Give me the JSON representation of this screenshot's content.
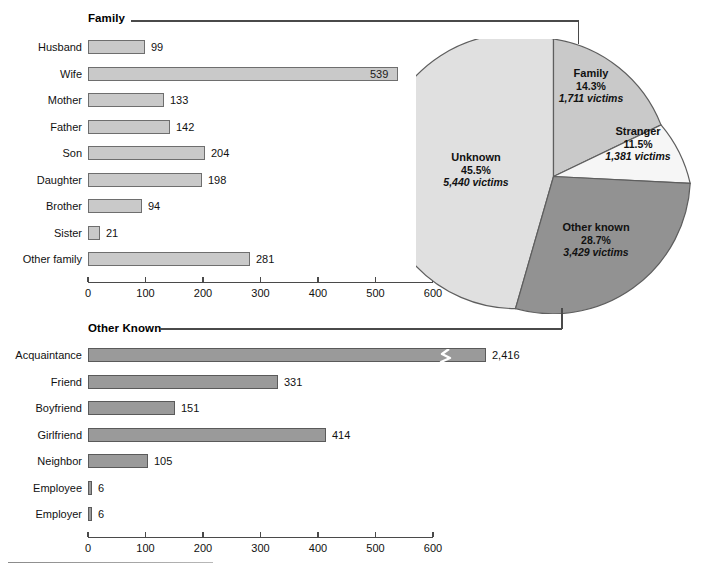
{
  "figure": {
    "sections": {
      "family_title": "Family",
      "other_known_title": "Other Known"
    }
  },
  "chart_data": [
    {
      "type": "bar",
      "orientation": "horizontal",
      "title": "Family",
      "xlabel": "",
      "ylabel": "",
      "xlim": [
        0,
        600
      ],
      "grid": false,
      "ticks": [
        "0",
        "100",
        "200",
        "300",
        "400",
        "500",
        "600"
      ],
      "tick_values": [
        0,
        100,
        200,
        300,
        400,
        500,
        600
      ],
      "categories": [
        "Husband",
        "Wife",
        "Mother",
        "Father",
        "Son",
        "Daughter",
        "Brother",
        "Sister",
        "Other family"
      ],
      "values": [
        99,
        539,
        133,
        142,
        204,
        198,
        94,
        21,
        281
      ],
      "value_labels": [
        "99",
        "539",
        "133",
        "142",
        "204",
        "198",
        "94",
        "21",
        "281"
      ],
      "label_inside": [
        false,
        true,
        false,
        false,
        false,
        false,
        false,
        false,
        false
      ],
      "bar_color": "#c9c9c9",
      "bar_border": "#6e6e6e"
    },
    {
      "type": "pie",
      "title": "",
      "legend": "in-slice labels",
      "total_victims": 11961,
      "slices": [
        {
          "name": "Family",
          "percent": 14.3,
          "percent_label": "14.3%",
          "victims": 1711,
          "victims_label": "1,711 victims",
          "color": "#c9c9c9"
        },
        {
          "name": "Stranger",
          "percent": 11.5,
          "percent_label": "11.5%",
          "victims": 1381,
          "victims_label": "1,381 victims",
          "color": "#f2f2f2"
        },
        {
          "name": "Other known",
          "percent": 28.7,
          "percent_label": "28.7%",
          "victims": 3429,
          "victims_label": "3,429 victims",
          "color": "#929292"
        },
        {
          "name": "Unknown",
          "percent": 45.5,
          "percent_label": "45.5%",
          "victims": 5440,
          "victims_label": "5,440 victims",
          "color": "#e0e0e0"
        }
      ]
    },
    {
      "type": "bar",
      "orientation": "horizontal",
      "title": "Other Known",
      "xlabel": "",
      "ylabel": "",
      "xlim": [
        0,
        600
      ],
      "grid": false,
      "ticks": [
        "0",
        "100",
        "200",
        "300",
        "400",
        "500",
        "600"
      ],
      "tick_values": [
        0,
        100,
        200,
        300,
        400,
        500,
        600
      ],
      "categories": [
        "Acquaintance",
        "Friend",
        "Boyfriend",
        "Girlfriend",
        "Neighbor",
        "Employee",
        "Employer"
      ],
      "values": [
        2416,
        331,
        151,
        414,
        105,
        6,
        6
      ],
      "value_labels": [
        "2,416",
        "331",
        "151",
        "414",
        "105",
        "6",
        "6"
      ],
      "axis_break": {
        "category": "Acquaintance",
        "note": "bar truncated with zigzag break",
        "drawn_to": 693
      },
      "bar_color": "#929292",
      "bar_border": "#5a5a5a"
    }
  ],
  "top_chart": {
    "rows": [
      {
        "label": "Husband",
        "value": "99",
        "w": 57,
        "inside": false
      },
      {
        "label": "Wife",
        "value": "539",
        "w": 310,
        "inside": true
      },
      {
        "label": "Mother",
        "value": "133",
        "w": 76,
        "inside": false
      },
      {
        "label": "Father",
        "value": "142",
        "w": 82,
        "inside": false
      },
      {
        "label": "Son",
        "value": "204",
        "w": 117,
        "inside": false
      },
      {
        "label": "Daughter",
        "value": "198",
        "w": 114,
        "inside": false
      },
      {
        "label": "Brother",
        "value": "94",
        "w": 54,
        "inside": false
      },
      {
        "label": "Sister",
        "value": "21",
        "w": 12,
        "inside": false
      },
      {
        "label": "Other family",
        "value": "281",
        "w": 162,
        "inside": false
      }
    ],
    "ticks": [
      "0",
      "100",
      "200",
      "300",
      "400",
      "500",
      "600"
    ]
  },
  "bottom_chart": {
    "rows": [
      {
        "label": "Acquaintance",
        "value": "2,416",
        "w": 398,
        "broken": true
      },
      {
        "label": "Friend",
        "value": "331",
        "w": 190,
        "broken": false
      },
      {
        "label": "Boyfriend",
        "value": "151",
        "w": 87,
        "broken": false
      },
      {
        "label": "Girlfriend",
        "value": "414",
        "w": 238,
        "broken": false
      },
      {
        "label": "Neighbor",
        "value": "105",
        "w": 60,
        "broken": false
      },
      {
        "label": "Employee",
        "value": "6",
        "w": 4,
        "broken": false
      },
      {
        "label": "Employer",
        "value": "6",
        "w": 4,
        "broken": false
      }
    ],
    "ticks": [
      "0",
      "100",
      "200",
      "300",
      "400",
      "500",
      "600"
    ]
  },
  "pie": {
    "slices": [
      {
        "name": "Family",
        "percent": "14.3%",
        "victims": "1,711 victims"
      },
      {
        "name": "Stranger",
        "percent": "11.5%",
        "victims": "1,381 victims"
      },
      {
        "name": "Other known",
        "percent": "28.7%",
        "victims": "3,429 victims"
      },
      {
        "name": "Unknown",
        "percent": "45.5%",
        "victims": "5,440 victims"
      }
    ]
  },
  "colors": {
    "family_slice": "#c9c9c9",
    "stranger_slice": "#f2f2f2",
    "other_known_slice": "#929292",
    "unknown_slice": "#e0e0e0",
    "bar_light": "#c9c9c9",
    "bar_mid": "#929292",
    "rule": "#4a4a4a"
  }
}
